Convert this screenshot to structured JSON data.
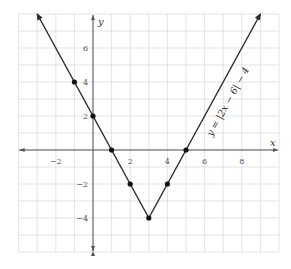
{
  "chart_data": {
    "type": "line",
    "title": "",
    "xlabel": "x",
    "ylabel": "y",
    "xlim": [
      -4,
      10
    ],
    "ylim": [
      -6,
      8
    ],
    "grid": true,
    "grid_step": 1,
    "x_ticks": [
      -2,
      2,
      4,
      6,
      8
    ],
    "y_ticks": [
      6,
      4,
      2,
      -2,
      -4
    ],
    "x_tick_labels": [
      "−2",
      "2",
      "4",
      "6",
      "8"
    ],
    "y_tick_labels": [
      "6",
      "4",
      "2",
      "−2",
      "−4"
    ],
    "series": [
      {
        "name": "y = |2x − 6| − 4",
        "equation_label": "y = |2x − 6| − 4",
        "x": [
          -3,
          3,
          9
        ],
        "y": [
          8,
          -4,
          8
        ],
        "marked_points": [
          {
            "x": -1,
            "y": 4
          },
          {
            "x": 0,
            "y": 2
          },
          {
            "x": 1,
            "y": 0
          },
          {
            "x": 2,
            "y": -2
          },
          {
            "x": 3,
            "y": -4
          },
          {
            "x": 4,
            "y": -2
          },
          {
            "x": 5,
            "y": 0
          }
        ],
        "arrows_at_ends": true
      }
    ]
  },
  "colors": {
    "grid": "#dcdcdc",
    "axis": "#555555",
    "line": "#2a2a2a",
    "point": "#111111"
  }
}
